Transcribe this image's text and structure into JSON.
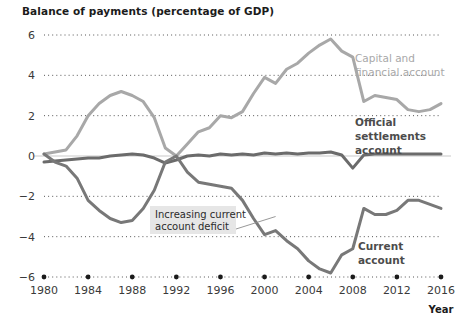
{
  "chart_data": {
    "type": "line",
    "title": "Balance of payments (percentage of GDP)",
    "xlabel": "Year",
    "ylabel": "",
    "xlim": [
      1980,
      2016
    ],
    "ylim": [
      -6,
      6
    ],
    "grid": true,
    "legend_position": "inline-labels",
    "xticks": [
      1980,
      1984,
      1988,
      1992,
      1996,
      2000,
      2004,
      2008,
      2012,
      2016
    ],
    "yticks": [
      6,
      4,
      2,
      0,
      -2,
      -4,
      -6
    ],
    "x": [
      1980,
      1981,
      1982,
      1983,
      1984,
      1985,
      1986,
      1987,
      1988,
      1989,
      1990,
      1991,
      1992,
      1993,
      1994,
      1995,
      1996,
      1997,
      1998,
      1999,
      2000,
      2001,
      2002,
      2003,
      2004,
      2005,
      2006,
      2007,
      2008,
      2009,
      2010,
      2011,
      2012,
      2013,
      2014,
      2015,
      2016
    ],
    "series": [
      {
        "name": "Capital and financial account",
        "color": "#a8a8a8",
        "label_lines": [
          "Capital and",
          "financial account"
        ],
        "values": [
          0.1,
          0.2,
          0.3,
          1.0,
          2.0,
          2.6,
          3.0,
          3.2,
          3.0,
          2.7,
          1.9,
          0.4,
          0.0,
          0.6,
          1.2,
          1.4,
          2.0,
          1.9,
          2.2,
          3.1,
          3.9,
          3.6,
          4.3,
          4.6,
          5.1,
          5.5,
          5.8,
          5.2,
          4.9,
          2.7,
          3.0,
          2.9,
          2.8,
          2.3,
          2.2,
          2.3,
          2.6
        ]
      },
      {
        "name": "Official settlements account",
        "color": "#6b6b6b",
        "label_lines": [
          "Official",
          "settlements",
          "account"
        ],
        "values": [
          -0.3,
          -0.25,
          -0.2,
          -0.15,
          -0.1,
          -0.1,
          0.0,
          0.05,
          0.1,
          0.05,
          -0.1,
          -0.35,
          -0.2,
          0.0,
          0.05,
          0.0,
          0.1,
          0.05,
          0.1,
          0.05,
          0.15,
          0.1,
          0.15,
          0.1,
          0.15,
          0.15,
          0.2,
          0.05,
          -0.6,
          0.05,
          0.1,
          0.1,
          0.1,
          0.1,
          0.1,
          0.1,
          0.1
        ]
      },
      {
        "name": "Current account",
        "color": "#787878",
        "label_lines": [
          "Current",
          "account"
        ],
        "values": [
          0.1,
          -0.3,
          -0.5,
          -1.1,
          -2.2,
          -2.7,
          -3.1,
          -3.3,
          -3.2,
          -2.6,
          -1.7,
          -0.3,
          0.0,
          -0.8,
          -1.3,
          -1.4,
          -1.5,
          -1.6,
          -2.2,
          -3.1,
          -3.9,
          -3.7,
          -4.2,
          -4.6,
          -5.2,
          -5.6,
          -5.8,
          -4.9,
          -4.6,
          -2.6,
          -2.9,
          -2.9,
          -2.7,
          -2.2,
          -2.2,
          -2.4,
          -2.6
        ]
      }
    ],
    "annotations": [
      {
        "text_lines": [
          "Increasing current",
          "account deficit"
        ],
        "target_x": 2001,
        "target_y": -3.0
      }
    ]
  }
}
